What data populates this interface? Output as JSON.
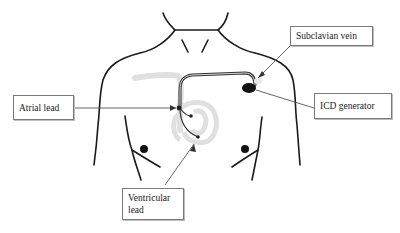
{
  "figure": {
    "labels": {
      "subclavian_vein": "Subclavian vein",
      "icd_generator": "ICD generator",
      "atrial_lead": "Atrial lead",
      "ventricular_lead": "Ventricular lead"
    },
    "caption_fragment": "",
    "colors": {
      "outline": "#1a1a1a",
      "vessel": "#e3e3e3",
      "lead": "#333333",
      "box_border": "#7a7a7a"
    }
  }
}
